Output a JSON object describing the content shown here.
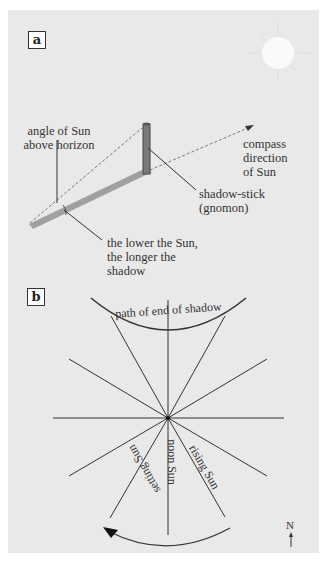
{
  "panel_a": {
    "label": "a",
    "annotations": {
      "angle_line1": "angle of Sun",
      "angle_line2": "above horizon",
      "compass_line1": "compass",
      "compass_line2": "direction",
      "compass_line3": "of Sun",
      "stick_line1": "shadow-stick",
      "stick_line2": "(gnomon)",
      "shadow_line1": "the lower the Sun,",
      "shadow_line2": "the longer the",
      "shadow_line3": "shadow"
    },
    "icons": [
      "sun-icon",
      "gnomon-icon"
    ]
  },
  "panel_b": {
    "label": "b",
    "annotations": {
      "path_label": "path of end of shadow",
      "setting": "setting Sun",
      "noon": "noon Sun",
      "rising": "rising Sun",
      "north": "N"
    }
  },
  "colors": {
    "panel_bg": "#e9e9e9",
    "ink": "#333333",
    "shadow": "#9a9a9a",
    "sun": "#f8f8f8"
  }
}
